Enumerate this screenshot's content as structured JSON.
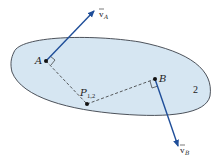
{
  "diagram": {
    "body_label": "2",
    "points": {
      "A": "A",
      "B": "B",
      "P": "P",
      "P_sub": "1,2"
    },
    "vectors": {
      "vA": {
        "symbol": "v",
        "sub": "A"
      },
      "vB": {
        "symbol": "v",
        "sub": "B"
      }
    },
    "colors": {
      "body_fill": "#d6e6f2",
      "body_stroke": "#3a3f48",
      "vector": "#1f4e99",
      "dashed": "#333333"
    }
  }
}
